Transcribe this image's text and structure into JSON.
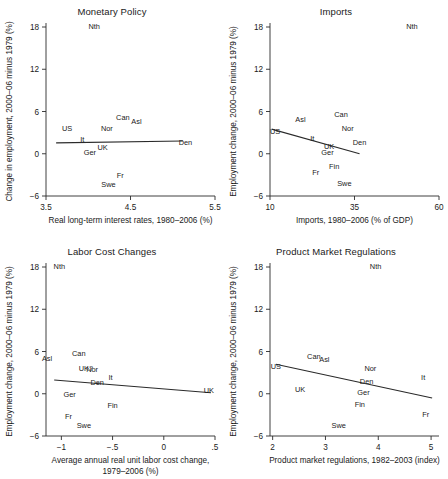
{
  "figure": {
    "width": 448,
    "height": 479,
    "background": "#ffffff",
    "ink_color": "#1a1a1a"
  },
  "chart_data": [
    {
      "type": "scatter",
      "title": "Monetary Policy",
      "xlabel": "Real long-term interest rates, 1980–2006 (%)",
      "ylabel": "Change in employment, 2000–06 minus 1979 (%)",
      "xlim": [
        3.5,
        5.5
      ],
      "ylim": [
        -6,
        18
      ],
      "xticks": [
        "3.5",
        "4.5",
        "5.5"
      ],
      "xtick_values": [
        3.5,
        4.5,
        5.5
      ],
      "yticks": [
        "18",
        "12",
        "6",
        "0",
        "−6"
      ],
      "ytick_values": [
        18,
        12,
        6,
        0,
        -6
      ],
      "grid": false,
      "legend": "none",
      "points": [
        {
          "label": "Nth",
          "x": 4.07,
          "y": 18.1
        },
        {
          "label": "Can",
          "x": 4.41,
          "y": 5.2
        },
        {
          "label": "Asl",
          "x": 4.57,
          "y": 4.6
        },
        {
          "label": "US",
          "x": 3.75,
          "y": 3.7
        },
        {
          "label": "Nor",
          "x": 4.22,
          "y": 3.6
        },
        {
          "label": "It",
          "x": 3.93,
          "y": 2.1
        },
        {
          "label": "UK",
          "x": 4.17,
          "y": 0.9
        },
        {
          "label": "Den",
          "x": 5.15,
          "y": 1.6
        },
        {
          "label": "Ger",
          "x": 4.02,
          "y": 0.2
        },
        {
          "label": "Fr",
          "x": 4.38,
          "y": -3.0
        },
        {
          "label": "Swe",
          "x": 4.24,
          "y": -4.3
        }
      ],
      "fit_line": {
        "x1": 3.62,
        "y1": 1.55,
        "x2": 5.12,
        "y2": 1.8
      }
    },
    {
      "type": "scatter",
      "title": "Imports",
      "xlabel": "Imports, 1980–2006 (% of GDP)",
      "ylabel": "Employment change, 2000–06 minus 1979 (%)",
      "xlim": [
        10,
        60
      ],
      "ylim": [
        -6,
        18
      ],
      "xticks": [
        "10",
        "35",
        "60"
      ],
      "xtick_values": [
        10,
        35,
        60
      ],
      "yticks": [
        "18",
        "12",
        "6",
        "0",
        "−6"
      ],
      "ytick_values": [
        18,
        12,
        6,
        0,
        -6
      ],
      "grid": false,
      "legend": "none",
      "points": [
        {
          "label": "Nth",
          "x": 52.0,
          "y": 18.1
        },
        {
          "label": "Can",
          "x": 31.0,
          "y": 5.6
        },
        {
          "label": "Asl",
          "x": 19.0,
          "y": 5.0
        },
        {
          "label": "Nor",
          "x": 33.0,
          "y": 3.7
        },
        {
          "label": "US",
          "x": 11.5,
          "y": 3.2
        },
        {
          "label": "It",
          "x": 22.5,
          "y": 2.2
        },
        {
          "label": "Den",
          "x": 36.5,
          "y": 1.7
        },
        {
          "label": "UK",
          "x": 27.5,
          "y": 1.1
        },
        {
          "label": "Ger",
          "x": 27.0,
          "y": 0.2
        },
        {
          "label": "Fin",
          "x": 29.0,
          "y": -1.7
        },
        {
          "label": "Fr",
          "x": 23.5,
          "y": -2.6
        },
        {
          "label": "Swe",
          "x": 32.0,
          "y": -4.2
        }
      ],
      "fit_line": {
        "x1": 10.5,
        "y1": 3.5,
        "x2": 36.5,
        "y2": 0.0
      }
    },
    {
      "type": "scatter",
      "title": "Labor Cost Changes",
      "xlabel": "Average annual real unit labor cost change,",
      "xlabel2": "1979–2006 (%)",
      "ylabel": "Employment change, 2000–06 minus 1979 (%)",
      "xlim": [
        -1.15,
        0.5
      ],
      "ylim": [
        -6,
        18
      ],
      "xticks": [
        "−1",
        "−.5",
        "0",
        ".5"
      ],
      "xtick_values": [
        -1,
        -0.5,
        0,
        0.5
      ],
      "yticks": [
        "18",
        "12",
        "6",
        "0",
        "−6"
      ],
      "ytick_values": [
        18,
        12,
        6,
        0,
        -6
      ],
      "grid": false,
      "legend": "none",
      "points": [
        {
          "label": "Nth",
          "x": -1.02,
          "y": 18.1
        },
        {
          "label": "Can",
          "x": -0.83,
          "y": 5.8
        },
        {
          "label": "Asl",
          "x": -1.14,
          "y": 5.1
        },
        {
          "label": "UK?",
          "x": -0.76,
          "y": 3.6
        },
        {
          "label": "Nor",
          "x": -0.7,
          "y": 3.5
        },
        {
          "label": "It",
          "x": -0.52,
          "y": 2.4
        },
        {
          "label": "Den",
          "x": -0.65,
          "y": 1.6
        },
        {
          "label": "UK",
          "x": 0.44,
          "y": 0.5
        },
        {
          "label": "Ger",
          "x": -0.92,
          "y": 0.0
        },
        {
          "label": "Fin",
          "x": -0.5,
          "y": -1.6
        },
        {
          "label": "Fr",
          "x": -0.93,
          "y": -3.2
        },
        {
          "label": "Swe",
          "x": -0.78,
          "y": -4.4
        }
      ],
      "fit_line": {
        "x1": -1.07,
        "y1": 1.95,
        "x2": 0.46,
        "y2": 0.15
      }
    },
    {
      "type": "scatter",
      "title": "Product Market Regulations",
      "xlabel": "Product market regulations, 1982–2003 (index)",
      "ylabel": "Employment change, 2000–06 minus 1979 (%)",
      "xlim": [
        1.95,
        5.15
      ],
      "ylim": [
        -6,
        18
      ],
      "xticks": [
        "2",
        "3",
        "4",
        "5"
      ],
      "xtick_values": [
        2,
        3,
        4,
        5
      ],
      "yticks": [
        "18",
        "12",
        "6",
        "0",
        "−6"
      ],
      "ytick_values": [
        18,
        12,
        6,
        0,
        -6
      ],
      "grid": false,
      "legend": "none",
      "points": [
        {
          "label": "Nth",
          "x": 3.95,
          "y": 18.1
        },
        {
          "label": "Can",
          "x": 2.78,
          "y": 5.4
        },
        {
          "label": "Asl",
          "x": 2.98,
          "y": 5.0
        },
        {
          "label": "Nor",
          "x": 3.85,
          "y": 3.7
        },
        {
          "label": "US",
          "x": 2.06,
          "y": 4.0
        },
        {
          "label": "It",
          "x": 4.85,
          "y": 2.4
        },
        {
          "label": "Den",
          "x": 3.78,
          "y": 1.8
        },
        {
          "label": "UK",
          "x": 2.52,
          "y": 0.7
        },
        {
          "label": "Ger",
          "x": 3.72,
          "y": 0.3
        },
        {
          "label": "Fin",
          "x": 3.65,
          "y": -1.5
        },
        {
          "label": "Fr",
          "x": 4.9,
          "y": -2.9
        },
        {
          "label": "Swe",
          "x": 3.25,
          "y": -4.5
        }
      ],
      "fit_line": {
        "x1": 2.06,
        "y1": 4.2,
        "x2": 5.02,
        "y2": -0.6
      }
    }
  ]
}
